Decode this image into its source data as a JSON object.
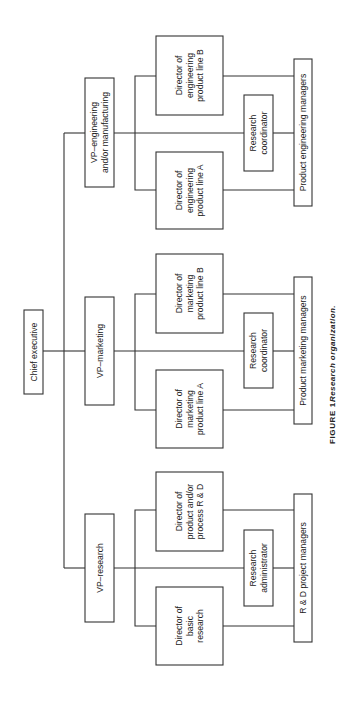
{
  "figure": {
    "label": "FIGURE 1.",
    "title": "Research organization.",
    "orientation": "rotated 90° counter-clockwise"
  },
  "chief": {
    "label": "Chief executive"
  },
  "groups": [
    {
      "vp": {
        "lines": [
          "VP–engineering",
          "and/or manufacturing"
        ]
      },
      "director_top": {
        "lines": [
          "Director of",
          "engineering",
          "product line B"
        ]
      },
      "director_bottom": {
        "lines": [
          "Director of",
          "engineering",
          "product line A"
        ]
      },
      "staff": {
        "lines": [
          "Research",
          "coordinator"
        ]
      },
      "managers": {
        "label": "Product engineering managers"
      }
    },
    {
      "vp": {
        "lines": [
          "VP–marketing"
        ]
      },
      "director_top": {
        "lines": [
          "Director of",
          "marketing",
          "product line B"
        ]
      },
      "director_bottom": {
        "lines": [
          "Director of",
          "marketing",
          "product line A"
        ]
      },
      "staff": {
        "lines": [
          "Research",
          "coordinator"
        ]
      },
      "managers": {
        "label": "Product marketing managers"
      }
    },
    {
      "vp": {
        "lines": [
          "VP–research"
        ]
      },
      "director_top": {
        "lines": [
          "Director of",
          "product and/or",
          "process R & D"
        ]
      },
      "director_bottom": {
        "lines": [
          "Director of",
          "basic",
          "research"
        ]
      },
      "staff": {
        "lines": [
          "Research",
          "administrator"
        ]
      },
      "managers": {
        "label": "R & D project managers"
      }
    }
  ],
  "colors": {
    "line": "#333333",
    "text": "#222222",
    "background": "#ffffff"
  }
}
